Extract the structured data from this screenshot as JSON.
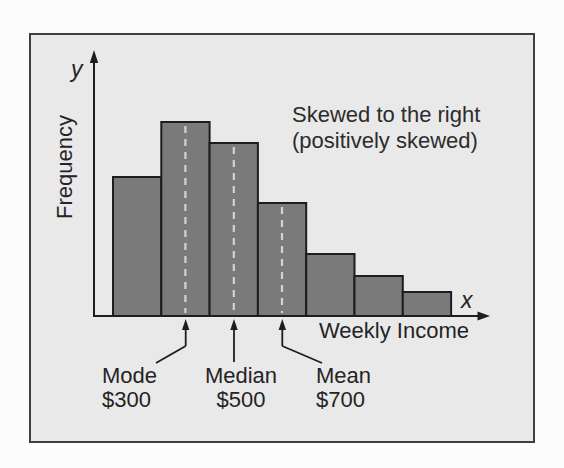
{
  "figure": {
    "annotation_line1": "Skewed to the right",
    "annotation_line2": "(positively skewed)"
  },
  "colors": {
    "page_bg": "#fcfcfc",
    "panel_bg": "#e9e9e9",
    "panel_border": "#3f3f3f",
    "bar_fill": "#7a7a7a",
    "bar_stroke": "#1d1d1d",
    "guide_dash": "#d2d2d2",
    "axis": "#1d1d1d",
    "text": "#242424"
  },
  "chart_data": {
    "type": "bar",
    "subtype": "histogram",
    "title": "",
    "xlabel": "Weekly Income",
    "ylabel": "Frequency",
    "x_axis_symbol": "x",
    "y_axis_symbol": "y",
    "categories": [
      "bin1",
      "bin2",
      "bin3",
      "bin4",
      "bin5",
      "bin6",
      "bin7"
    ],
    "values_relative": [
      0.72,
      1.0,
      0.89,
      0.58,
      0.32,
      0.21,
      0.12
    ],
    "axis_ticks": "none",
    "grid": false,
    "annotations": [
      "Skewed to the right",
      "(positively skewed)"
    ],
    "skew_direction": "right (positively skewed)",
    "statistics": [
      {
        "label": "Mode",
        "value": "$300",
        "at_bar_index": 1
      },
      {
        "label": "Median",
        "value": "$500",
        "at_bar_index": 2
      },
      {
        "label": "Mean",
        "value": "$700",
        "at_bar_index": 3
      }
    ],
    "render": {
      "left": 113,
      "bar_width": 48.3,
      "baseline": 316,
      "heights_px": [
        139,
        194,
        173,
        113,
        62,
        40,
        24
      ],
      "guide_bar_indices": [
        1,
        2,
        3
      ]
    }
  }
}
